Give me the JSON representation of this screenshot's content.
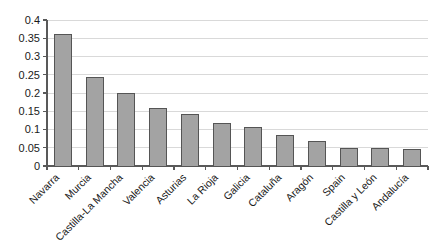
{
  "chart_data": {
    "type": "bar",
    "title": "",
    "subtitle": "",
    "xlabel": "",
    "ylabel": "",
    "categories": [
      "Navarra",
      "Murcia",
      "Castilla-La Mancha",
      "Valencia",
      "Asturias",
      "La Rioja",
      "Galicia",
      "Cataluña",
      "Aragón",
      "Spain",
      "Castilla y León",
      "Andalucía"
    ],
    "values": [
      0.36,
      0.242,
      0.199,
      0.158,
      0.141,
      0.117,
      0.106,
      0.083,
      0.067,
      0.049,
      0.049,
      0.046
    ],
    "ylim": [
      0,
      0.4
    ],
    "yticks": [
      0,
      0.05,
      0.1,
      0.15,
      0.2,
      0.25,
      0.3,
      0.35,
      0.4
    ],
    "ytick_labels": [
      "0",
      "0.05",
      "0.1",
      "0.15",
      "0.2",
      "0.25",
      "0.3",
      "0.35",
      "0.4"
    ],
    "grid": true,
    "grid_axis": "y",
    "legend": false,
    "legend_position": "none",
    "series": [
      {
        "name": "series-1",
        "values": [
          0.36,
          0.242,
          0.199,
          0.158,
          0.141,
          0.117,
          0.106,
          0.083,
          0.067,
          0.049,
          0.049,
          0.046
        ]
      }
    ],
    "annotations": []
  },
  "style": {
    "bar_fill": "#a3a3a3",
    "bar_stroke": "#555555",
    "grid_color": "#d9d9d9",
    "axis_color": "#595959",
    "background": "#ffffff",
    "label_color": "#1a1a1a",
    "category_label_rotation": -45
  },
  "geometry": {
    "plot_left": 47,
    "plot_right": 428,
    "plot_top": 20,
    "plot_bottom": 166,
    "bar_width": 17,
    "category_pitch": 31.75
  }
}
